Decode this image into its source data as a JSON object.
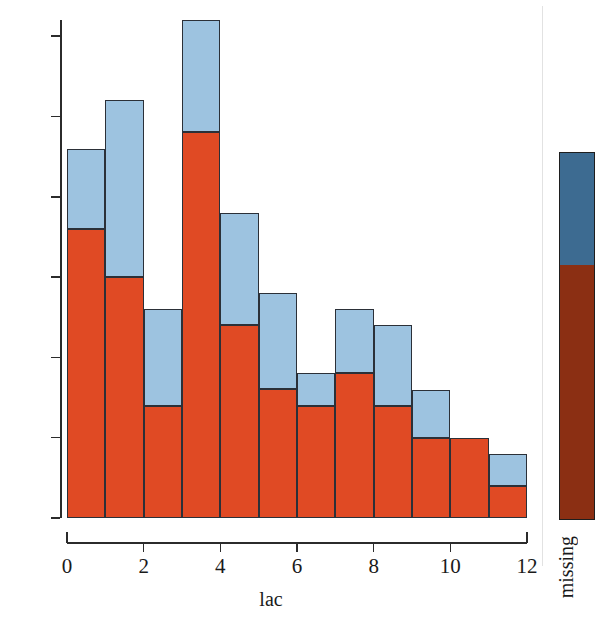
{
  "chart_data": {
    "type": "bar",
    "subtype": "stacked-histogram",
    "title": "",
    "xlabel": "lac",
    "ylabel": "",
    "xlim": [
      0,
      12
    ],
    "ylim": [
      0,
      31
    ],
    "grid": false,
    "bin_width": 1,
    "categories": [
      "0-1",
      "1-2",
      "2-3",
      "3-4",
      "4-5",
      "5-6",
      "6-7",
      "7-8",
      "8-9",
      "9-10",
      "10-11",
      "11-12"
    ],
    "bin_starts": [
      0,
      1,
      2,
      3,
      4,
      5,
      6,
      7,
      8,
      9,
      10,
      11
    ],
    "series": [
      {
        "name": "not-missing",
        "color": "#e04a24",
        "values": [
          18,
          15,
          7,
          24,
          12,
          8,
          7,
          9,
          7,
          5,
          5,
          2
        ]
      },
      {
        "name": "missing",
        "color": "#9dc3e0",
        "values": [
          5,
          11,
          6,
          7,
          7,
          6,
          2,
          4,
          5,
          3,
          0,
          2
        ]
      }
    ],
    "totals": [
      23,
      26,
      13,
      31,
      19,
      14,
      9,
      13,
      12,
      8,
      5,
      4
    ],
    "y_axis": {
      "ticks": [
        0,
        5,
        10,
        15,
        20,
        25,
        30
      ],
      "tick_labels": [
        "0",
        "5",
        "10",
        "15",
        "20",
        "25",
        "30"
      ],
      "max": 31
    },
    "x_axis": {
      "ticks": [
        0,
        2,
        4,
        6,
        8,
        10,
        12
      ],
      "tick_labels": [
        "0",
        "2",
        "4",
        "6",
        "8",
        "10",
        "12"
      ]
    },
    "legend": {
      "position": "right",
      "title": "missing",
      "orientation": "vertical-colorbar",
      "segments": [
        {
          "label": "missing",
          "color": "#3d6b91",
          "fraction": 0.307
        },
        {
          "label": "present",
          "color": "#8b2f13",
          "fraction": 0.693
        }
      ]
    },
    "colors": {
      "bar_lower": "#e04a24",
      "bar_upper": "#9dc3e0",
      "bar_outline": "#2b3038",
      "legend_upper": "#3d6b91",
      "legend_lower": "#8b2f13",
      "axis": "#2b2b2b"
    }
  }
}
